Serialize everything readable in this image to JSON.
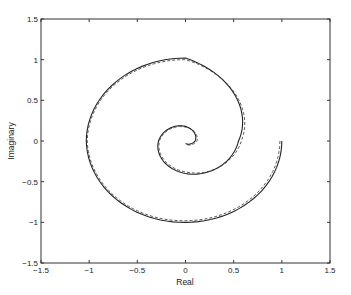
{
  "chart_data": {
    "type": "line",
    "title": "",
    "xlabel": "Real",
    "ylabel": "Imaginary",
    "xlim": [
      -1.5,
      1.5
    ],
    "ylim": [
      -1.5,
      1.5
    ],
    "xticks": [
      "-1.5",
      "-1",
      "-0.5",
      "0",
      "0.5",
      "1",
      "1.5"
    ],
    "yticks": [
      "-1.5",
      "-1",
      "-0.5",
      "0",
      "0.5",
      "1",
      "1.5"
    ],
    "grid": false,
    "legend": null,
    "series": [
      {
        "name": "solid",
        "style": "solid",
        "description": "Decaying spiral starting at (1, 0), rotating clockwise toward origin",
        "start": [
          1.0,
          0.0
        ],
        "points": [
          [
            1.0,
            0.0
          ],
          [
            0.0,
            -1.0
          ],
          [
            -1.03,
            0.0
          ],
          [
            0.0,
            1.02
          ],
          [
            0.55,
            0.0
          ],
          [
            0.0,
            -0.4
          ],
          [
            -0.28,
            0.0
          ],
          [
            0.0,
            0.18
          ],
          [
            0.1,
            0.0
          ],
          [
            0.0,
            -0.03
          ]
        ]
      },
      {
        "name": "dashed",
        "style": "dashed",
        "description": "Approximation spiral nearly overlapping the solid curve, slightly offset inward",
        "points": [
          [
            0.98,
            0.0
          ],
          [
            0.0,
            -0.98
          ],
          [
            -1.02,
            0.0
          ],
          [
            0.0,
            1.0
          ],
          [
            0.58,
            0.0
          ],
          [
            0.0,
            -0.38
          ],
          [
            -0.27,
            0.0
          ],
          [
            0.0,
            0.17
          ],
          [
            0.12,
            0.0
          ],
          [
            0.0,
            -0.04
          ]
        ]
      }
    ]
  },
  "axes": {
    "xlabel": "Real",
    "ylabel": "Imaginary",
    "xticks": [
      "-1.5",
      "-1",
      "-0.5",
      "0",
      "0.5",
      "1",
      "1.5"
    ],
    "yticks": [
      "1.5",
      "1",
      "0.5",
      "0",
      "-0.5",
      "-1",
      "-1.5"
    ]
  }
}
